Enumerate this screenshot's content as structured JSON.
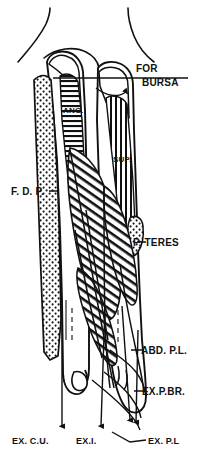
{
  "figure": {
    "view": "anterior-posterior line drawing of radius and ulna",
    "ink_color": "#111111",
    "background_color": "#ffffff"
  },
  "labels": {
    "for_bursa": {
      "line1": "FOR",
      "line2": "BURSA",
      "position": "right-upper",
      "leader": "horizontal-line-with-hook"
    },
    "anconeus": {
      "text": "ANC.",
      "position": "inside-proximal-ulna",
      "fill_pattern": "horizontal-hatch"
    },
    "supinator": {
      "text": "SUP.",
      "position": "inside-proximal-radius",
      "fill_pattern": "vertical-hatch"
    },
    "flexor_digitorum_profundus": {
      "text": "F. D. P.",
      "position": "left-middle",
      "fill_pattern": "stipple"
    },
    "pronator_teres": {
      "text": "P. TERES",
      "position": "right-middle",
      "fill_pattern": "stipple"
    },
    "abductor_pollicis_longus": {
      "text": "ABD. P.L.",
      "position": "right-lower",
      "leader": "short-dash"
    },
    "extensor_pollicis_brevis": {
      "text": "EX.P.BR.",
      "position": "right-lower",
      "leader": "short-dash"
    },
    "extensor_carpi_ulnaris": {
      "text": "EX. C.U.",
      "position": "bottom-left",
      "leader": "vertical-arrow"
    },
    "extensor_indicis": {
      "text": "EX.I.",
      "position": "bottom-center",
      "leader": "vertical-arrow"
    },
    "extensor_pollicis_longus": {
      "text": "EX. P.L",
      "position": "bottom-right",
      "leader": "arrow-pair"
    }
  },
  "fill_patterns": {
    "stipple": "dots",
    "horizontal_hatch": "horizontal-lines",
    "vertical_hatch": "vertical-lines",
    "diagonal_hatch": "diagonal-lines"
  }
}
